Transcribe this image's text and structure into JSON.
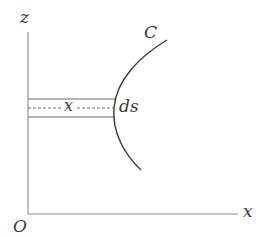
{
  "diagram": {
    "axes": {
      "vertical_label": "z",
      "horizontal_label": "x",
      "origin_label": "O"
    },
    "curve": {
      "label": "C"
    },
    "strip": {
      "width_label": "x",
      "element_label": "ds"
    },
    "colors": {
      "axis": "#8a8a8a",
      "curve": "#3a3a3a",
      "strip": "#6a6a6a",
      "text": "#3a3a3a",
      "background": "#ffffff"
    }
  }
}
